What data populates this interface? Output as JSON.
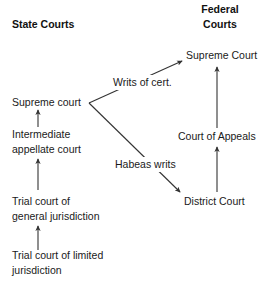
{
  "diagram": {
    "title_state": "State Courts",
    "title_federal": "Federal\nCourts",
    "headings": [
      {
        "id": "state-courts",
        "label": "State Courts"
      },
      {
        "id": "federal-courts",
        "label": "Federal\nCourts"
      }
    ],
    "nodes": [
      {
        "id": "state-supreme-court",
        "label": "Supreme court"
      },
      {
        "id": "state-intermediate-appellate-court",
        "label": "Intermediate\nappellate court"
      },
      {
        "id": "state-trial-court-general",
        "label": "Trial court of\ngeneral jurisdiction"
      },
      {
        "id": "state-trial-court-limited",
        "label": "Trial court of limited\njurisdiction"
      },
      {
        "id": "federal-supreme-court",
        "label": "Supreme Court"
      },
      {
        "id": "federal-court-of-appeals",
        "label": "Court of Appeals"
      },
      {
        "id": "federal-district-court",
        "label": "District Court"
      }
    ],
    "edge_labels": [
      {
        "id": "writs-of-cert",
        "label": "Writs of cert."
      },
      {
        "id": "habeas-writs",
        "label": "Habeas writs"
      }
    ],
    "colors": {
      "background": "#ffffff",
      "text": "#1a1a1a",
      "heading_text": "#111111",
      "edge_stroke": "#333333"
    }
  }
}
